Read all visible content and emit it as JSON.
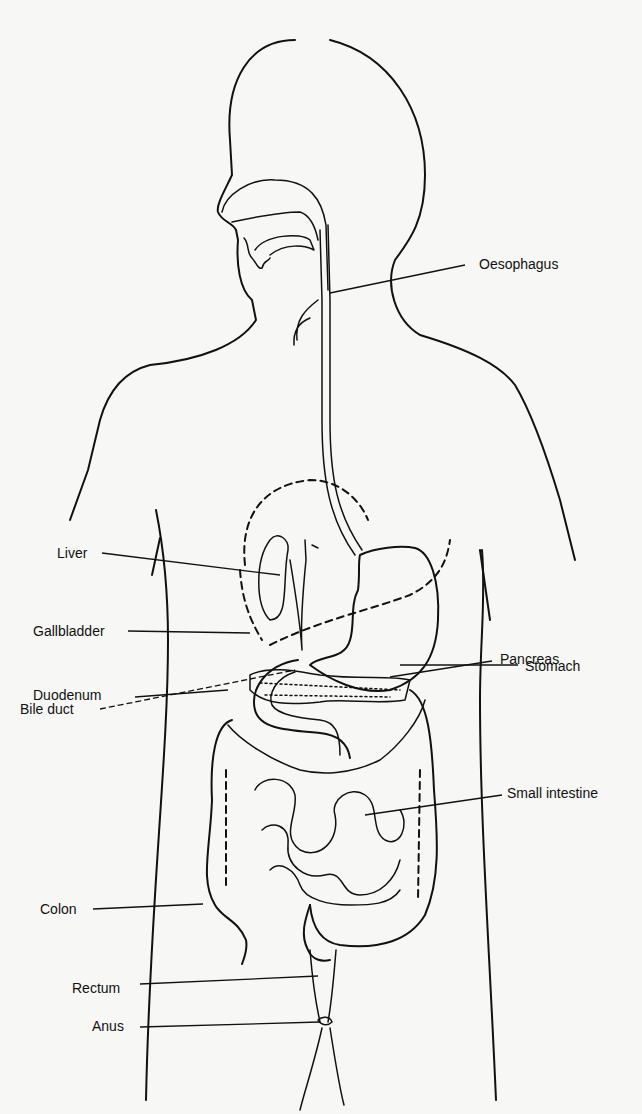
{
  "diagram": {
    "labels": {
      "oesophagus": "Oesophagus",
      "liver": "Liver",
      "gallbladder": "Gallbladder",
      "stomach": "Stomach",
      "bile_duct": "Bile duct",
      "pancreas": "Pancreas",
      "duodenum": "Duodenum",
      "small_intestine": "Small intestine",
      "colon": "Colon",
      "rectum": "Rectum",
      "anus": "Anus"
    },
    "colors": {
      "background": "#f7f7f5",
      "line": "#111111"
    }
  }
}
